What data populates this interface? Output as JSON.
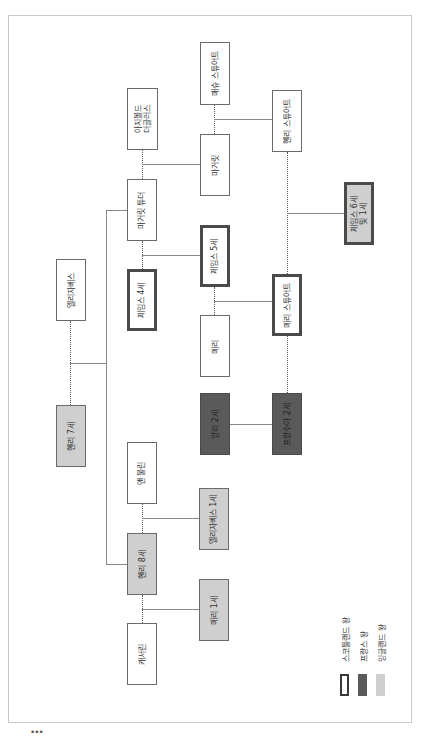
{
  "diagram": {
    "type": "family-tree",
    "orientation": "rotated-90-ccw",
    "people": [
      {
        "id": "archibald",
        "label": "아치볼드\n더글러스",
        "kind": "none"
      },
      {
        "id": "matthew",
        "label": "매슈 스튜어트",
        "kind": "none"
      },
      {
        "id": "henry_stuart",
        "label": "헨리 스튜어트",
        "kind": "none"
      },
      {
        "id": "margaret",
        "label": "마거릿",
        "kind": "none"
      },
      {
        "id": "margaret_tudor",
        "label": "마거릿 튜더",
        "kind": "none"
      },
      {
        "id": "james6",
        "label": "제임스 6세\n및 1세",
        "kind": "scotland+england"
      },
      {
        "id": "james5",
        "label": "제임스 5세",
        "kind": "scotland"
      },
      {
        "id": "elizabeth_york",
        "label": "엘리자베스",
        "kind": "none"
      },
      {
        "id": "james4",
        "label": "제임스 4세",
        "kind": "scotland"
      },
      {
        "id": "mary_guise",
        "label": "메리",
        "kind": "none"
      },
      {
        "id": "mary_stuart",
        "label": "메리 스튜어트",
        "kind": "scotland"
      },
      {
        "id": "henry7",
        "label": "헨리 7세",
        "kind": "england"
      },
      {
        "id": "henri2",
        "label": "앙리 2세",
        "kind": "france"
      },
      {
        "id": "francois2",
        "label": "프랑수아 2세",
        "kind": "france"
      },
      {
        "id": "anne_boleyn",
        "label": "앤 불린",
        "kind": "none"
      },
      {
        "id": "elizabeth1",
        "label": "엘리자베스 1세",
        "kind": "england"
      },
      {
        "id": "henry8",
        "label": "헨리 8세",
        "kind": "england"
      },
      {
        "id": "mary1",
        "label": "메리 1세",
        "kind": "england"
      },
      {
        "id": "catherine",
        "label": "캐서린",
        "kind": "none"
      }
    ]
  },
  "legend": {
    "items": [
      {
        "label": "스코틀랜드 왕",
        "style": "thick-outline"
      },
      {
        "label": "프랑스 왕",
        "style": "dark-fill"
      },
      {
        "label": "잉글랜드 왕",
        "style": "light-fill"
      }
    ]
  },
  "colors": {
    "scotland_border": "#4a4a4a",
    "france_fill": "#5a5a5a",
    "england_fill": "#cfcfcf"
  },
  "footer": {
    "ellipsis": "•••"
  }
}
